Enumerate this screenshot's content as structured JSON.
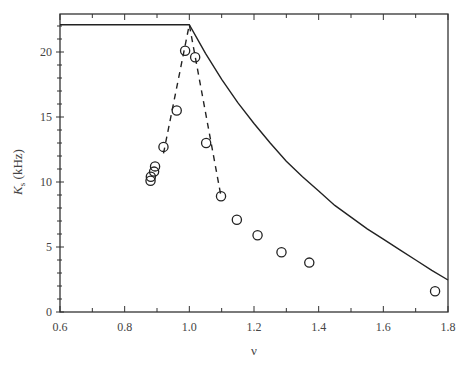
{
  "chart_data": {
    "type": "scatter",
    "title": "",
    "xlabel": "ν",
    "ylabel": "K_s (kHz)",
    "ylabel_main": "K",
    "ylabel_sub": "s",
    "ylabel_unit": " (kHz)",
    "xlim": [
      0.6,
      1.8
    ],
    "ylim": [
      0,
      23
    ],
    "grid": false,
    "legend": null,
    "x_ticks": [
      0.6,
      0.8,
      1.0,
      1.2,
      1.4,
      1.6,
      1.8
    ],
    "x_tick_labels": [
      "0.6",
      "0.8",
      "1.0",
      "1.2",
      "1.4",
      "1.6",
      "1.8"
    ],
    "x_minor_ticks": [
      0.7,
      0.9,
      1.1,
      1.3,
      1.5,
      1.7
    ],
    "y_ticks": [
      0,
      5,
      10,
      15,
      20
    ],
    "y_tick_labels": [
      "0",
      "5",
      "10",
      "15",
      "20"
    ],
    "y_minor_ticks": [
      1,
      2,
      3,
      4,
      6,
      7,
      8,
      9,
      11,
      12,
      13,
      14,
      16,
      17,
      18,
      19,
      21,
      22
    ],
    "series": [
      {
        "name": "data points",
        "style": "open-circle",
        "x": [
          0.88,
          0.881,
          0.891,
          0.894,
          0.92,
          0.961,
          0.987,
          1.018,
          1.052,
          1.098,
          1.147,
          1.211,
          1.285,
          1.371,
          1.76
        ],
        "y": [
          10.1,
          10.4,
          10.8,
          11.2,
          12.7,
          15.5,
          20.1,
          19.6,
          13.0,
          8.9,
          7.1,
          5.9,
          4.6,
          3.8,
          1.6
        ]
      },
      {
        "name": "theory (solid)",
        "style": "solid-line",
        "x": [
          0.6,
          1.0,
          1.05,
          1.1,
          1.15,
          1.2,
          1.25,
          1.3,
          1.35,
          1.4,
          1.45,
          1.5,
          1.55,
          1.6,
          1.65,
          1.7,
          1.75,
          1.8
        ],
        "y": [
          22.1,
          22.1,
          19.9,
          17.9,
          16.1,
          14.5,
          13.0,
          11.6,
          10.4,
          9.3,
          8.2,
          7.3,
          6.4,
          5.6,
          4.8,
          4.0,
          3.2,
          2.46
        ]
      },
      {
        "name": "fit (dashed)",
        "style": "dashed-line",
        "x": [
          0.92,
          1.0,
          1.098
        ],
        "y": [
          12.2,
          22.1,
          8.9
        ]
      }
    ]
  }
}
